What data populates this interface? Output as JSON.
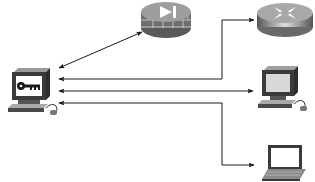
{
  "diagram": {
    "type": "network-topology",
    "colors": {
      "background": "#ffffff",
      "line": "#1a1a1a",
      "device_dark": "#3a3a3a",
      "device_mid": "#8a8a8a",
      "device_light": "#cfcfcf",
      "screen": "#e6e6e6"
    },
    "nodes": [
      {
        "id": "key-workstation",
        "icon": "workstation-with-key-icon"
      },
      {
        "id": "firewall",
        "icon": "firewall-icon"
      },
      {
        "id": "router",
        "icon": "router-icon"
      },
      {
        "id": "desktop-pc",
        "icon": "desktop-computer-icon"
      },
      {
        "id": "laptop",
        "icon": "laptop-icon"
      }
    ],
    "connections": [
      {
        "from": "key-workstation",
        "to": "firewall",
        "arrows": "both"
      },
      {
        "from": "key-workstation",
        "to": "router",
        "arrows": "both",
        "route": "elbow"
      },
      {
        "from": "key-workstation",
        "to": "desktop-pc",
        "arrows": "both"
      },
      {
        "from": "key-workstation",
        "to": "laptop",
        "arrows": "both",
        "route": "elbow"
      }
    ]
  }
}
